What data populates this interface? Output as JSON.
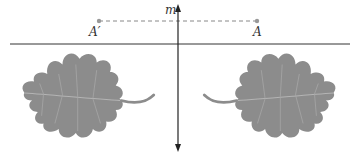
{
  "diagram": {
    "line_label": "m",
    "point_image_label": "A′",
    "point_original_label": "A",
    "colors": {
      "leaf": "#8c8c8c",
      "leaf_vein": "#b4b4b4",
      "line": "#222222",
      "point": "#999999",
      "dashed": "#888888"
    }
  }
}
